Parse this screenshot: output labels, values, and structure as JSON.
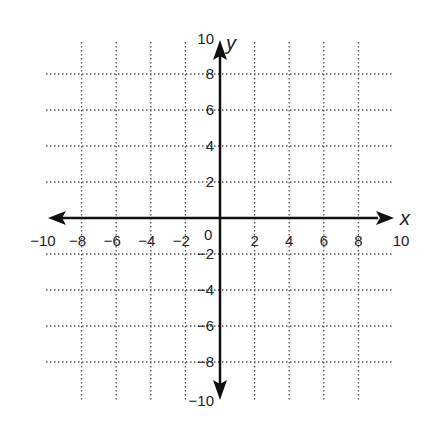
{
  "diagram": {
    "type": "coordinate-plane",
    "x_axis": {
      "label": "x",
      "min": -10,
      "max": 10,
      "step": 2,
      "tick_labels": [
        "−10",
        "−8",
        "−6",
        "−4",
        "−2",
        "2",
        "4",
        "6",
        "8",
        "10"
      ]
    },
    "y_axis": {
      "label": "y",
      "min": -10,
      "max": 10,
      "step": 2,
      "tick_labels": [
        "10",
        "8",
        "6",
        "4",
        "2",
        "−2",
        "−4",
        "−6",
        "−8",
        "−10"
      ]
    },
    "origin_label": "0",
    "grid": {
      "style": "dotted",
      "color": "#555555"
    },
    "axis_color": "#111111"
  }
}
